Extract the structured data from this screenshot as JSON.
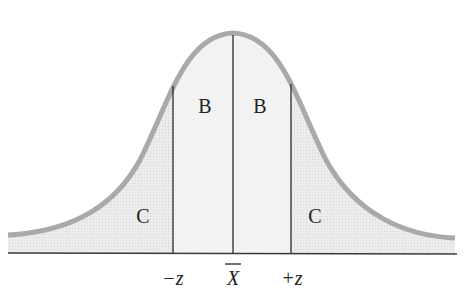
{
  "diagram": {
    "type": "normal-distribution",
    "regions": [
      {
        "id": "left-tail",
        "label": "C"
      },
      {
        "id": "left-center",
        "label": "B"
      },
      {
        "id": "right-center",
        "label": "B"
      },
      {
        "id": "right-tail",
        "label": "C"
      }
    ],
    "axis_labels": {
      "minus_z": "−z",
      "mean": "X",
      "plus_z": "+z"
    },
    "colors": {
      "curve": "#a9a9a9",
      "center_fill": "#f1f1f1",
      "tail_fill": "#e3e3e3",
      "lines": "#2a2a2a"
    }
  }
}
